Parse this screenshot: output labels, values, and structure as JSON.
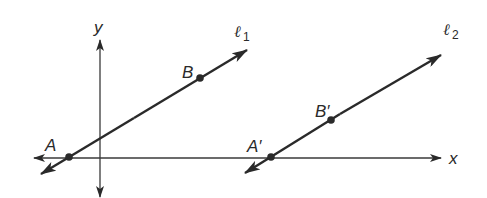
{
  "diagram": {
    "axes": {
      "x_label": "x",
      "y_label": "y"
    },
    "lines": [
      {
        "name": "l1",
        "symbol": "ℓ",
        "subscript": "1",
        "points": [
          "A",
          "B"
        ]
      },
      {
        "name": "l2",
        "symbol": "ℓ",
        "subscript": "2",
        "points": [
          "A'",
          "B'"
        ]
      }
    ],
    "points": {
      "A": "A",
      "B": "B",
      "A_prime": "A′",
      "B_prime": "B′"
    },
    "colors": {
      "stroke": "#2a2a2a",
      "background": "#ffffff"
    }
  }
}
